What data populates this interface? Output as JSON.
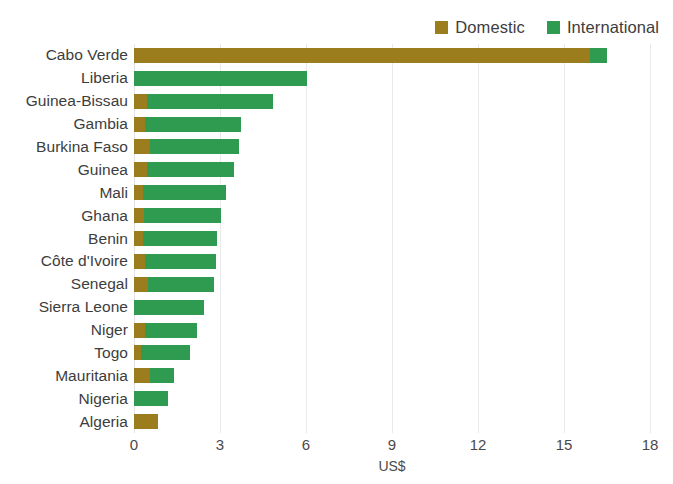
{
  "legend": {
    "position": "top-right",
    "entries": [
      {
        "label": "Domestic",
        "color": "#9c7d1e",
        "icon": "square-swatch-icon"
      },
      {
        "label": "International",
        "color": "#2f9b51",
        "icon": "square-swatch-icon"
      }
    ]
  },
  "axis": {
    "x_title": "US$",
    "ticks": [
      "0",
      "3",
      "6",
      "9",
      "12",
      "15",
      "18"
    ]
  },
  "chart_data": {
    "type": "bar",
    "orientation": "horizontal",
    "stacked": true,
    "title": "",
    "subtitle": "",
    "xlabel": "US$",
    "ylabel": "",
    "xlim": [
      0,
      18
    ],
    "xticks": [
      0,
      3,
      6,
      9,
      12,
      15,
      18
    ],
    "grid": true,
    "legend_position": "top-right",
    "categories": [
      "Cabo Verde",
      "Liberia",
      "Guinea-Bissau",
      "Gambia",
      "Burkina Faso",
      "Guinea",
      "Mali",
      "Ghana",
      "Benin",
      "Côte d'Ivoire",
      "Senegal",
      "Sierra Leone",
      "Niger",
      "Togo",
      "Mauritania",
      "Nigeria",
      "Algeria"
    ],
    "series": [
      {
        "name": "Domestic",
        "color": "#9c7d1e",
        "values": [
          15.9,
          0.0,
          0.45,
          0.4,
          0.55,
          0.45,
          0.3,
          0.35,
          0.3,
          0.4,
          0.5,
          0.0,
          0.4,
          0.25,
          0.55,
          0.0,
          0.85
        ]
      },
      {
        "name": "International",
        "color": "#2f9b51",
        "values": [
          0.6,
          6.05,
          4.4,
          3.35,
          3.1,
          3.05,
          2.9,
          2.7,
          2.6,
          2.45,
          2.3,
          2.45,
          1.8,
          1.7,
          0.85,
          1.2,
          0.0
        ]
      }
    ],
    "totals": [
      16.5,
      6.05,
      4.85,
      3.75,
      3.65,
      3.5,
      3.2,
      3.05,
      2.9,
      2.85,
      2.8,
      2.45,
      2.2,
      1.95,
      1.4,
      1.2,
      0.85
    ]
  }
}
